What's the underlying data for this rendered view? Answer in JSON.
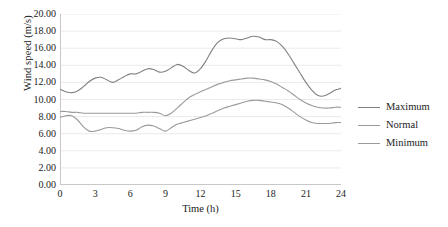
{
  "chart_data": {
    "type": "line",
    "title": "",
    "xlabel": "Time (h)",
    "ylabel": "Wind speed (m/s)",
    "xlim": [
      0,
      24
    ],
    "ylim": [
      0,
      20
    ],
    "grid": "horizontal",
    "legend_position": "right",
    "x_ticks": [
      "0",
      "3",
      "6",
      "9",
      "12",
      "15",
      "18",
      "21",
      "24"
    ],
    "x_tick_values": [
      0,
      3,
      6,
      9,
      12,
      15,
      18,
      21,
      24
    ],
    "y_ticks": [
      "0.00",
      "2.00",
      "4.00",
      "6.00",
      "8.00",
      "10.00",
      "12.00",
      "14.00",
      "16.00",
      "18.00",
      "20.00"
    ],
    "y_tick_values": [
      0,
      2,
      4,
      6,
      8,
      10,
      12,
      14,
      16,
      18,
      20
    ],
    "x": [
      0,
      0.5,
      1,
      1.5,
      2,
      2.5,
      3,
      3.5,
      4,
      4.5,
      5,
      5.5,
      6,
      6.5,
      7,
      7.5,
      8,
      8.5,
      9,
      9.5,
      10,
      10.5,
      11,
      11.5,
      12,
      12.5,
      13,
      13.5,
      14,
      14.5,
      15,
      15.5,
      16,
      16.5,
      17,
      17.5,
      18,
      18.5,
      19,
      19.5,
      20,
      20.5,
      21,
      21.5,
      22,
      22.5,
      23,
      23.5,
      24
    ],
    "series": [
      {
        "name": "Maximum",
        "color": "#808080",
        "values": [
          11.2,
          10.9,
          10.8,
          11.0,
          11.5,
          12.1,
          12.5,
          12.6,
          12.3,
          12.0,
          12.3,
          12.7,
          13.0,
          13.0,
          13.3,
          13.6,
          13.5,
          13.2,
          13.3,
          13.7,
          14.1,
          13.9,
          13.4,
          13.1,
          13.6,
          14.6,
          15.8,
          16.7,
          17.1,
          17.2,
          17.1,
          17.0,
          17.2,
          17.4,
          17.3,
          17.0,
          17.0,
          16.8,
          16.2,
          15.3,
          14.2,
          13.1,
          12.0,
          11.1,
          10.5,
          10.4,
          10.7,
          11.1,
          11.3
        ]
      },
      {
        "name": "Normal",
        "color": "#9a9a9a",
        "values": [
          8.6,
          8.6,
          8.5,
          8.5,
          8.4,
          8.4,
          8.4,
          8.4,
          8.4,
          8.4,
          8.4,
          8.4,
          8.4,
          8.4,
          8.5,
          8.5,
          8.5,
          8.4,
          8.1,
          8.4,
          9.0,
          9.6,
          10.2,
          10.6,
          10.9,
          11.2,
          11.5,
          11.8,
          12.0,
          12.2,
          12.3,
          12.4,
          12.5,
          12.5,
          12.4,
          12.3,
          12.1,
          11.8,
          11.4,
          11.0,
          10.5,
          10.0,
          9.6,
          9.3,
          9.1,
          9.0,
          9.0,
          9.1,
          9.1
        ]
      },
      {
        "name": "Minimum",
        "color": "#9a9a9a",
        "values": [
          7.9,
          8.1,
          8.1,
          7.6,
          6.8,
          6.3,
          6.3,
          6.5,
          6.7,
          6.7,
          6.6,
          6.4,
          6.3,
          6.4,
          6.8,
          7.0,
          6.9,
          6.6,
          6.3,
          6.7,
          7.1,
          7.3,
          7.5,
          7.7,
          7.9,
          8.1,
          8.4,
          8.7,
          9.0,
          9.2,
          9.4,
          9.6,
          9.8,
          9.9,
          9.9,
          9.8,
          9.7,
          9.6,
          9.4,
          9.0,
          8.5,
          8.0,
          7.6,
          7.3,
          7.2,
          7.2,
          7.2,
          7.3,
          7.3
        ]
      }
    ],
    "style": {
      "gridline_color": "#ebebeb",
      "axis_color": "#c8c8c8",
      "text_color": "#1b1b1b",
      "background": "#ffffff"
    }
  },
  "legend": {
    "items": [
      {
        "label": "Maximum"
      },
      {
        "label": "Normal"
      },
      {
        "label": "Minimum"
      }
    ]
  }
}
